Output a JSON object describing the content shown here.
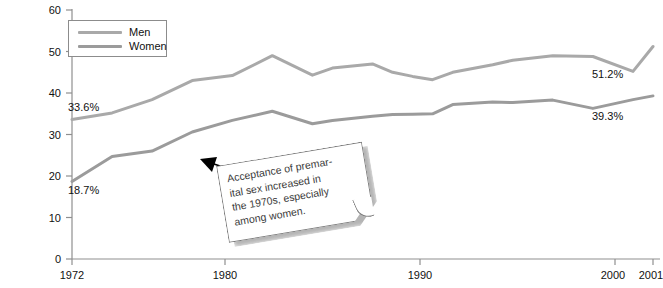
{
  "chart_data": {
    "type": "line",
    "title": "",
    "xlabel": "",
    "ylabel": "",
    "xlim": [
      1972,
      2001
    ],
    "ylim": [
      0,
      60
    ],
    "grid": false,
    "legend_position": "top-left",
    "y_ticks": [
      0,
      10,
      20,
      30,
      40,
      50,
      60
    ],
    "x_ticks": [
      1972,
      1980,
      1990,
      2000,
      2001
    ],
    "x": [
      1972,
      1974,
      1976,
      1978,
      1980,
      1982,
      1984,
      1985,
      1987,
      1988,
      1989,
      1990,
      1991,
      1993,
      1994,
      1996,
      1998,
      2000,
      2001
    ],
    "series": [
      {
        "name": "Men",
        "color": "#a9a9a9",
        "values": [
          33.6,
          35.2,
          38.4,
          43.0,
          44.2,
          49.0,
          44.3,
          46.0,
          47.0,
          45.0,
          44.0,
          43.2,
          45.0,
          46.8,
          47.9,
          49.0,
          48.8,
          45.2,
          51.2
        ],
        "start_label": "33.6%",
        "end_label": "51.2%"
      },
      {
        "name": "Women",
        "color": "#9b9b9b",
        "values": [
          18.7,
          24.7,
          26.0,
          30.6,
          33.4,
          35.6,
          32.6,
          33.4,
          34.4,
          34.8,
          34.9,
          35.0,
          37.2,
          37.8,
          37.7,
          38.3,
          36.3,
          38.4,
          39.3
        ],
        "start_label": "18.7%",
        "end_label": "39.3%"
      }
    ],
    "annotation": {
      "lines": [
        "Acceptance of premar-",
        "ital sex increased in",
        "the 1970s, especially",
        "among women."
      ],
      "arrow_points_to": "women-line-1979"
    }
  },
  "legend": {
    "items": [
      {
        "label": "Men"
      },
      {
        "label": "Women"
      }
    ]
  },
  "axis": {
    "y_labels": [
      "60",
      "50",
      "40",
      "30",
      "20",
      "10",
      "0"
    ],
    "x_labels": [
      "1972",
      "1980",
      "1990",
      "2000",
      "2001"
    ]
  },
  "colors": {
    "men": "#a9a9a9",
    "women": "#9b9b9b",
    "axis": "#8f8f8f",
    "text": "#111111"
  }
}
